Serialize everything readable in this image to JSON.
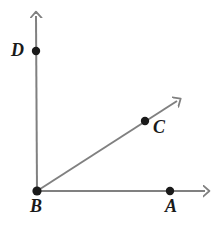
{
  "figure": {
    "name": "angle-diagram",
    "background_color": "#ffffff",
    "line_color": "#808080",
    "point_color": "#1a1a1a",
    "label_color": "#1a1a1a"
  },
  "points": [
    {
      "id": "D",
      "label": "D",
      "x": 36,
      "y": 51,
      "label_x": 11,
      "label_y": 41
    },
    {
      "id": "C",
      "label": "C",
      "x": 145,
      "y": 121,
      "label_x": 153,
      "label_y": 118
    },
    {
      "id": "B",
      "label": "B",
      "x": 37,
      "y": 191,
      "label_x": 30,
      "label_y": 197
    },
    {
      "id": "A",
      "label": "A",
      "x": 170,
      "y": 191,
      "label_x": 165,
      "label_y": 197
    }
  ],
  "rays": [
    {
      "id": "ray-BD",
      "from": "B",
      "through": "D",
      "x1": 37,
      "y1": 191,
      "x2": 36,
      "y2": 16,
      "direction": "up"
    },
    {
      "id": "ray-BA",
      "from": "B",
      "through": "A",
      "x1": 37,
      "y1": 191,
      "x2": 205,
      "y2": 191,
      "direction": "right"
    },
    {
      "id": "ray-BC",
      "from": "B",
      "through": "C",
      "x1": 37,
      "y1": 191,
      "x2": 177,
      "y2": 101,
      "direction": "up-right"
    }
  ]
}
